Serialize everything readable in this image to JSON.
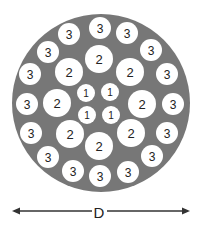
{
  "diagram": {
    "colors": {
      "outer_disk": "#777777",
      "strand_fill": "#ffffff",
      "label": "#222222",
      "dimension_line": "#333333"
    },
    "layers": [
      {
        "layer": "1",
        "label": "1",
        "count": 4
      },
      {
        "layer": "2",
        "label": "2",
        "count": 8
      },
      {
        "layer": "3",
        "label": "3",
        "count": 16
      }
    ],
    "dimension": {
      "label": "D",
      "meaning": "outer diameter"
    }
  }
}
